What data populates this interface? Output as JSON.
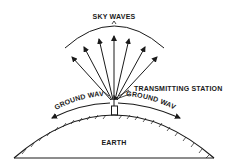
{
  "diagram": {
    "labels": {
      "sky_waves": "SKY WAVES",
      "transmitting_station": "TRANSMITTING STATION",
      "ground_wave_left": "GROUND WAVE",
      "ground_wave_right": "GROUND WAVE",
      "earth": "EARTH"
    },
    "colors": {
      "ink": "#1a1a1a",
      "background": "#ffffff"
    },
    "sky_wave_arrow_count": 7
  }
}
